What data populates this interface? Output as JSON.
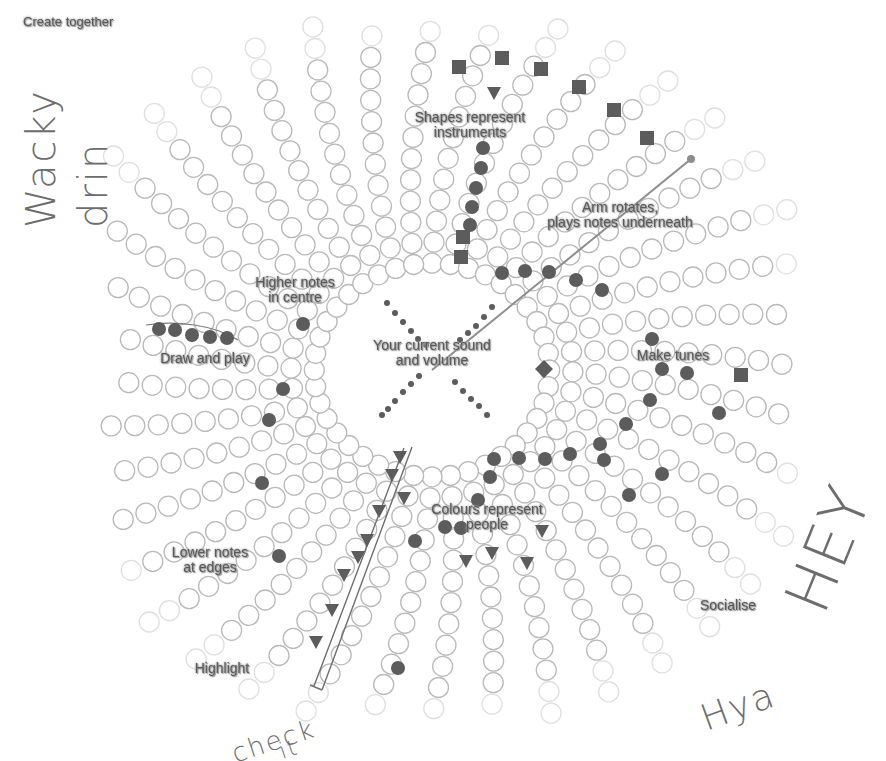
{
  "diagram": {
    "title": "Create together",
    "center": {
      "x": 432,
      "y": 370,
      "inner_radius": 95
    },
    "colors": {
      "ring_stroke": "#b9b9b9",
      "note_fill": "#5c5c5c",
      "arm": "#8d8d8d",
      "ink": "#6d6d6d",
      "label": "#5a5a5a"
    },
    "grid": {
      "spokes": 40,
      "circles_per_spoke": 13,
      "spacing": 21.5,
      "radius": 10
    },
    "labels": [
      {
        "id": "shapes",
        "text": "Shapes represent\ninstruments",
        "x": 470,
        "y": 125
      },
      {
        "id": "arm",
        "text": "Arm rotates,\nplays notes underneath",
        "x": 620,
        "y": 215
      },
      {
        "id": "higher",
        "text": "Higher notes\nin centre",
        "x": 295,
        "y": 290
      },
      {
        "id": "draw",
        "text": "Draw and play",
        "x": 205,
        "y": 358
      },
      {
        "id": "current",
        "text": "Your current sound\nand volume",
        "x": 432,
        "y": 353
      },
      {
        "id": "tunes",
        "text": "Make tunes",
        "x": 673,
        "y": 355
      },
      {
        "id": "colours",
        "text": "Colours represent\npeople",
        "x": 487,
        "y": 517
      },
      {
        "id": "lower",
        "text": "Lower notes\nat edges",
        "x": 210,
        "y": 560
      },
      {
        "id": "highlight",
        "text": "Highlight",
        "x": 222,
        "y": 668
      },
      {
        "id": "socialise",
        "text": "Socialise",
        "x": 728,
        "y": 605
      }
    ],
    "arm_line": {
      "x1": 432,
      "y1": 370,
      "x2": 691,
      "y2": 159
    },
    "notes": {
      "circles": [
        [
          483,
          148
        ],
        [
          481,
          168
        ],
        [
          476,
          188
        ],
        [
          472,
          207
        ],
        [
          470,
          225
        ],
        [
          502,
          273
        ],
        [
          525,
          271
        ],
        [
          549,
          272
        ],
        [
          576,
          280
        ],
        [
          602,
          290
        ],
        [
          303,
          324
        ],
        [
          652,
          339
        ],
        [
          662,
          369
        ],
        [
          687,
          373
        ],
        [
          159,
          329
        ],
        [
          175,
          330
        ],
        [
          192,
          335
        ],
        [
          210,
          337
        ],
        [
          227,
          338
        ],
        [
          283,
          389
        ],
        [
          269,
          420
        ],
        [
          650,
          400
        ],
        [
          626,
          424
        ],
        [
          604,
          460
        ],
        [
          719,
          413
        ],
        [
          662,
          474
        ],
        [
          629,
          495
        ],
        [
          494,
          459
        ],
        [
          519,
          458
        ],
        [
          545,
          459
        ],
        [
          570,
          454
        ],
        [
          600,
          444
        ],
        [
          490,
          477
        ],
        [
          478,
          500
        ],
        [
          445,
          527
        ],
        [
          461,
          528
        ],
        [
          415,
          541
        ],
        [
          262,
          483
        ],
        [
          279,
          556
        ],
        [
          398,
          668
        ]
      ],
      "squares": [
        [
          459,
          67
        ],
        [
          502,
          58
        ],
        [
          541,
          69
        ],
        [
          579,
          87
        ],
        [
          614,
          110
        ],
        [
          647,
          138
        ],
        [
          463,
          237
        ],
        [
          461,
          257
        ],
        [
          741,
          375
        ]
      ],
      "triangles": [
        [
          494,
          93
        ],
        [
          400,
          457
        ],
        [
          392,
          475
        ],
        [
          404,
          498
        ],
        [
          379,
          511
        ],
        [
          367,
          540
        ],
        [
          358,
          557
        ],
        [
          344,
          575
        ],
        [
          332,
          610
        ],
        [
          316,
          642
        ],
        [
          466,
          561
        ],
        [
          492,
          553
        ],
        [
          527,
          563
        ],
        [
          542,
          531
        ]
      ],
      "diamonds": [
        [
          544,
          369
        ]
      ],
      "center_dots": [
        [
          387,
          303
        ],
        [
          395,
          313
        ],
        [
          403,
          322
        ],
        [
          411,
          331
        ],
        [
          418,
          339
        ],
        [
          426,
          345
        ],
        [
          492,
          307
        ],
        [
          484,
          317
        ],
        [
          476,
          326
        ],
        [
          468,
          333
        ],
        [
          460,
          340
        ],
        [
          419,
          376
        ],
        [
          411,
          384
        ],
        [
          403,
          392
        ],
        [
          395,
          401
        ],
        [
          388,
          409
        ],
        [
          382,
          415
        ],
        [
          455,
          382
        ],
        [
          463,
          391
        ],
        [
          471,
          399
        ],
        [
          479,
          406
        ],
        [
          487,
          415
        ]
      ]
    },
    "highlight_lasso": "M 404 448 L 314 686 M 412 447 L 322 690 M 310 685 L 322 690",
    "draw_lasso": "M 146 325 C 175 320, 215 325, 238 340"
  },
  "annotations": [
    {
      "id": "wacky",
      "text": "Wacky",
      "x": 18,
      "y": 228,
      "rotate": -90,
      "size": 40
    },
    {
      "id": "drin",
      "text": "drin",
      "x": 70,
      "y": 228,
      "rotate": -90,
      "size": 40
    },
    {
      "id": "hey",
      "text": "HEY",
      "x": 770,
      "y": 595,
      "rotate": -68,
      "size": 62
    },
    {
      "id": "hya",
      "text": "Hya",
      "x": 695,
      "y": 700,
      "rotate": -20,
      "size": 36
    },
    {
      "id": "check",
      "text": "check",
      "x": 228,
      "y": 740,
      "rotate": -18,
      "size": 26
    },
    {
      "id": "it",
      "text": "it",
      "x": 276,
      "y": 740,
      "rotate": -18,
      "size": 22
    }
  ]
}
